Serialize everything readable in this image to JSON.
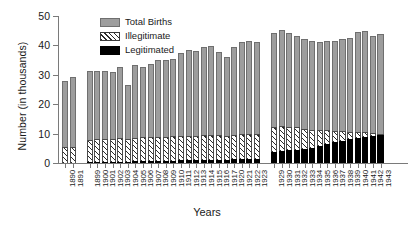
{
  "chart_data": {
    "type": "bar",
    "title": "",
    "subtitle": "",
    "xlabel": "Years",
    "ylabel": "Number (in thousands)",
    "ylim": [
      0,
      50
    ],
    "yticks": [
      0,
      10,
      20,
      30,
      40,
      50
    ],
    "grid": false,
    "legend_position": "top-left",
    "stacked": true,
    "note": "Bars are grouped in three blocks separated by gaps: 1890-1891, 1899-1923 (1918-1919 absent), 1929-1943. Total Births is the full bar height; Illegitimate and Legitimated are sub-portions measured from the baseline.",
    "categories": [
      "1890",
      "1891",
      "1899",
      "1900",
      "1901",
      "1902",
      "1903",
      "1904",
      "1905",
      "1906",
      "1907",
      "1908",
      "1909",
      "1910",
      "1911",
      "1912",
      "1913",
      "1914",
      "1915",
      "1916",
      "1917",
      "1920",
      "1921",
      "1922",
      "1923",
      "1929",
      "1930",
      "1931",
      "1932",
      "1933",
      "1934",
      "1935",
      "1936",
      "1937",
      "1938",
      "1939",
      "1940",
      "1941",
      "1942",
      "1943"
    ],
    "series": [
      {
        "name": "Total Births",
        "color": "#9d9d9d",
        "values": [
          28.0,
          29.2,
          31.4,
          31.2,
          31.2,
          31.0,
          32.7,
          26.4,
          33.3,
          32.7,
          33.8,
          35.0,
          35.0,
          35.3,
          37.3,
          38.6,
          38.2,
          39.6,
          39.9,
          37.7,
          36.0,
          39.6,
          41.2,
          41.5,
          41.2,
          44.1,
          45.2,
          44.3,
          43.3,
          42.2,
          41.5,
          41.0,
          41.4,
          41.6,
          42.2,
          42.6,
          44.5,
          44.8,
          43.2,
          43.8
        ]
      },
      {
        "name": "Illegitimate",
        "color": "hatched",
        "values": [
          5.4,
          5.6,
          8.0,
          8.1,
          8.2,
          8.3,
          8.5,
          8.3,
          8.6,
          8.7,
          8.8,
          9.0,
          9.0,
          9.1,
          9.2,
          9.3,
          9.3,
          9.4,
          9.5,
          9.4,
          9.2,
          9.6,
          9.8,
          9.9,
          9.8,
          12.4,
          12.5,
          12.3,
          12.1,
          11.7,
          11.4,
          11.2,
          11.1,
          11.0,
          10.8,
          10.7,
          10.5,
          10.4,
          10.1,
          9.9
        ]
      },
      {
        "name": "Legitimated",
        "color": "#000000",
        "values": [
          0.0,
          0.0,
          0.3,
          0.3,
          0.4,
          0.4,
          0.5,
          0.5,
          0.6,
          0.6,
          0.7,
          0.7,
          0.8,
          0.8,
          0.9,
          0.9,
          1.0,
          1.0,
          1.1,
          1.1,
          1.1,
          1.2,
          1.2,
          1.3,
          1.3,
          3.7,
          4.1,
          4.3,
          4.5,
          4.7,
          5.2,
          5.8,
          6.4,
          7.0,
          7.5,
          8.0,
          8.6,
          9.0,
          9.3,
          9.6
        ]
      }
    ],
    "gaps_after": [
      "1891",
      "1923"
    ]
  },
  "legend": {
    "items": [
      {
        "label": "Total Births"
      },
      {
        "label": "Illegitimate"
      },
      {
        "label": "Legitimated"
      }
    ]
  }
}
